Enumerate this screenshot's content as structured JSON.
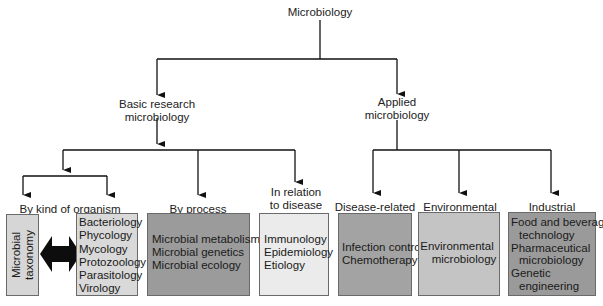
{
  "root": {
    "label": "Microbiology"
  },
  "branches": {
    "basic": {
      "label_line1": "Basic research",
      "label_line2": "microbiology"
    },
    "applied": {
      "label_line1": "Applied",
      "label_line2": "microbiology"
    }
  },
  "categories": {
    "kind_of_organism": {
      "label": "By kind of organism"
    },
    "by_process": {
      "label": "By process"
    },
    "disease_relation": {
      "label_line1": "In relation",
      "label_line2": "to disease"
    },
    "disease_related": {
      "label": "Disease-related"
    },
    "environmental": {
      "label": "Environmental"
    },
    "industrial": {
      "label": "Industrial"
    }
  },
  "boxes": {
    "taxonomy": {
      "line1": "Microbial",
      "line2": "taxonomy",
      "color": "#d6d6d6"
    },
    "organisms": {
      "items": [
        "Bacteriology",
        "Phycology",
        "Mycology",
        "Protozoology",
        "Parasitology",
        "Virology"
      ],
      "color": "#d9d9d9"
    },
    "process": {
      "items": [
        "Microbial metabolism",
        "Microbial genetics",
        "Microbial ecology"
      ],
      "color": "#9b9b9b"
    },
    "disease": {
      "items": [
        "Immunology",
        "Epidemiology",
        "Etiology"
      ],
      "color": "#ebebeb"
    },
    "disease_related": {
      "items": [
        "Infection control",
        "Chemotherapy"
      ],
      "color": "#a3a3a3"
    },
    "environmental": {
      "items": [
        "Environmental",
        "microbiology"
      ],
      "color": "#c4c4c4"
    },
    "industrial": {
      "items": [
        "Food and beverage",
        "technology",
        "Pharmaceutical",
        "microbiology",
        "Genetic",
        "engineering"
      ],
      "color": "#9a9a9a"
    }
  },
  "connector": {
    "double_arrow": "bidirectional-arrow",
    "color": "#111111"
  }
}
